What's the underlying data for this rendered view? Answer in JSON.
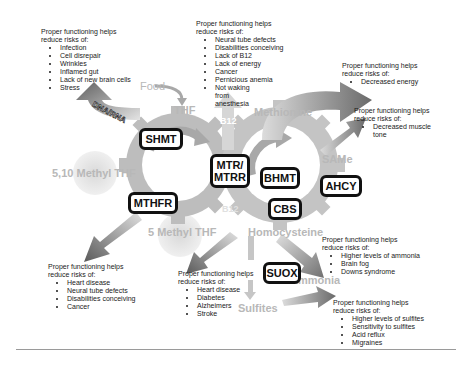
{
  "diagram": {
    "enzymes": {
      "shmt": "SHMT",
      "mtr": "MTR/\nMTRR",
      "mtr_line1": "MTR/",
      "mtr_line2": "MTRR",
      "bhmt": "BHMT",
      "ahcy": "AHCY",
      "cbs": "CBS",
      "mthfr": "MTHFR",
      "suox": "SUOX"
    },
    "metabolites": {
      "food": "Food",
      "thf": "THF",
      "b12_top": "B12",
      "methionine": "Methionine",
      "same": "SAMe",
      "methyl_510": "5,10 Methyl THF",
      "methyl_5": "5 Methyl THF",
      "b12_bottom": "B12",
      "homocysteine": "Homocysteine",
      "ammonia": "Ammonia",
      "sulfites": "Sulfites",
      "dna_rna": "DNA/RNA"
    },
    "notes": {
      "shmt": {
        "heading1": "Proper functioning helps",
        "heading2": "reduce risks of:",
        "items": [
          "Infection",
          "Cell disrepair",
          "Wrinkles",
          "Inflamed gut",
          "Lack of new brain cells",
          "Stress"
        ]
      },
      "mtr": {
        "heading1": "Proper functioning helps",
        "heading2": "reduce risks of:",
        "items": [
          "Neural tube defects",
          "Disabilities conceiving",
          "Lack of B12",
          "Lack of energy",
          "Cancer",
          "Pernicious anemia",
          "Not waking from anesthesia"
        ]
      },
      "methionine": {
        "heading1": "Proper functioning helps",
        "heading2": "reduce risks of:",
        "items": [
          "Decreased energy"
        ]
      },
      "same": {
        "heading1": "Proper functioning helps",
        "heading2": "reduce risks of:",
        "items": [
          "Decreased muscle tone"
        ]
      },
      "mthfr": {
        "heading1": "Proper functioning helps",
        "heading2": "reduce risks of:",
        "items": [
          "Heart disease",
          "Neural tube defects",
          "Disabilities conceiving",
          "Cancer"
        ]
      },
      "cbs": {
        "heading1": "Proper functioning helps",
        "heading2": "reduce risks of:",
        "items": [
          "Heart disease",
          "Diabetes",
          "Alzheimers",
          "Stroke"
        ]
      },
      "ammonia": {
        "heading1": "Proper functioning helps",
        "heading2": "reduce risks of:",
        "items": [
          "Higher levels of ammonia",
          "Brain fog",
          "Downs syndrome"
        ]
      },
      "sulfites": {
        "heading1": "Proper functioning helps",
        "heading2": "reduce risks of:",
        "items": [
          "Higher levels of sulfites",
          "Sensitivity to sulfites",
          "Acid reflux",
          "Migraines"
        ]
      }
    },
    "colors": {
      "gear": "#b5b5b5",
      "gear_light": "#d4d4d4",
      "arrow_dark": "#6e6e6e",
      "arrow_light": "#d8d8d8",
      "enzyme_border": "#111111",
      "metabolite_text": "#b8b8b8"
    }
  }
}
